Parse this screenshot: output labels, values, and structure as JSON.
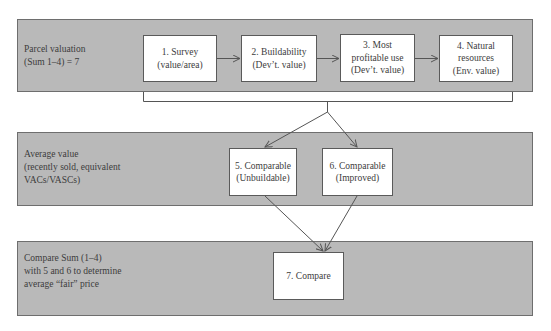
{
  "diagram": {
    "rows": [
      {
        "label_lines": [
          "Parcel valuation",
          "(Sum 1–4) = 7"
        ],
        "boxes": [
          {
            "lines": [
              "1. Survey",
              "(value/area)"
            ]
          },
          {
            "lines": [
              "2. Buildability",
              "(Dev’t. value)"
            ]
          },
          {
            "lines": [
              "3. Most",
              "profitable use",
              "(Dev’t. value)"
            ]
          },
          {
            "lines": [
              "4. Natural",
              "resources",
              "(Env. value)"
            ]
          }
        ]
      },
      {
        "label_lines": [
          "Average value",
          "(recently sold, equivalent",
          "VACs/VASCs)"
        ],
        "boxes": [
          {
            "lines": [
              "5. Comparable",
              "(Unbuildable)"
            ]
          },
          {
            "lines": [
              "6. Comparable",
              "(Improved)"
            ]
          }
        ]
      },
      {
        "label_lines": [
          "Compare Sum (1–4)",
          "with 5 and 6 to determine",
          "average “fair” price"
        ],
        "boxes": [
          {
            "lines": [
              "7. Compare"
            ]
          }
        ]
      }
    ],
    "colors": {
      "panel_fill": "#b9b9b9",
      "panel_border": "#6e6e6e",
      "box_fill": "#ffffff",
      "line": "#555555"
    }
  }
}
